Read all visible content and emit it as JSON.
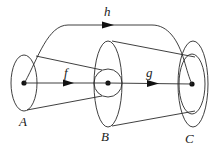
{
  "diagram": {
    "type": "commutative-diagram-with-cones",
    "nodes": [
      {
        "id": "A",
        "label": "A"
      },
      {
        "id": "B",
        "label": "B"
      },
      {
        "id": "C",
        "label": "C"
      }
    ],
    "edges": [
      {
        "id": "f",
        "label": "f",
        "from": "A",
        "to": "B"
      },
      {
        "id": "g",
        "label": "g",
        "from": "B",
        "to": "C"
      },
      {
        "id": "h",
        "label": "h",
        "from": "A",
        "to": "C"
      }
    ],
    "colors": {
      "stroke": "#2a2a2a",
      "text": "#1a1a1a",
      "background": "#ffffff"
    }
  }
}
